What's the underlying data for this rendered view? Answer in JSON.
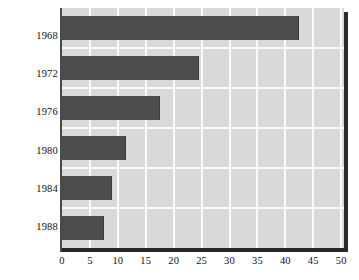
{
  "chart_data": {
    "type": "bar",
    "orientation": "horizontal",
    "title": "",
    "xlabel": "",
    "ylabel": "Election year",
    "categories": [
      "1968",
      "1972",
      "1976",
      "1980",
      "1984",
      "1988"
    ],
    "values": [
      42.5,
      24.5,
      17.5,
      11.5,
      9,
      7.5
    ],
    "series": [
      {
        "name": "",
        "values": [
          42.5,
          24.5,
          17.5,
          11.5,
          9,
          7.5
        ]
      }
    ],
    "xlim": [
      0,
      50.5
    ],
    "ylim": [
      0,
      6
    ],
    "xticks": [
      0,
      5,
      10,
      15,
      20,
      25,
      30,
      35,
      40,
      45,
      50
    ],
    "xtick_labels": [
      "0",
      "5",
      "10",
      "15",
      "20",
      "25",
      "30",
      "35",
      "40",
      "45",
      "50"
    ],
    "ytick_labels": [
      "1968",
      "1972",
      "1976",
      "1980",
      "1984",
      "1988"
    ],
    "grid": true,
    "grid_color": "#fbfbfb",
    "grid_axis": "both",
    "legend": false,
    "legend_position": "none",
    "bar_color": "#4c4c4c",
    "plot_background": "#d9d9d9",
    "page_background": "#ffffff",
    "axis_color": "#262626"
  }
}
